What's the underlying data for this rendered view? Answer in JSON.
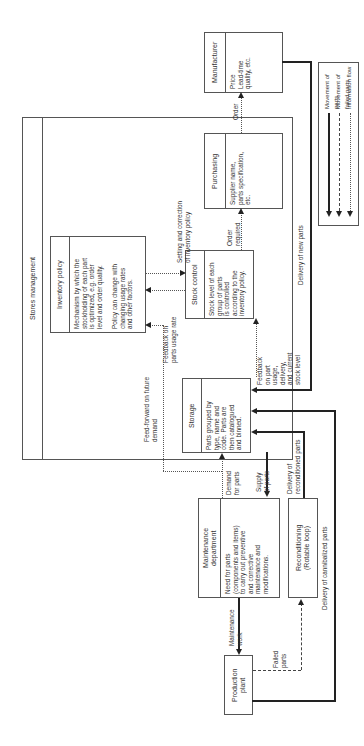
{
  "diagram": {
    "orientation": "rotated 90 degrees counter-clockwise",
    "stores_management": {
      "title": "Stores management"
    },
    "inventory_policy": {
      "title": "Inventory policy",
      "body": "Mechanism by which the\nstockholding of each part\nis optimized, e.g. order\nlevel and order quality.\n\nPolicy can change with\nchanging usage rates\nand other factors."
    },
    "stock_control": {
      "title": "Stock control",
      "body": "Stock level of each\ngroup of parts\nis controlled\naccording to the\ninventory policy."
    },
    "storage": {
      "title": "Storage",
      "body": "Parts grouped by\ntype, name and\ncode. Parts are\nthen catalogued\nand binned."
    },
    "purchasing": {
      "title": "Purchasing",
      "body": "Supplier name,\nparts specification,\netc."
    },
    "manufacturer": {
      "title": "Manufacturer",
      "body": "Price\nLead-time\nquality, etc."
    },
    "maintenance": {
      "title": "Maintenance\ndepartment",
      "body": "Need for parts\n(components and items)\nto carry out preventive\nand corrective\nmaintenance and\nmodifications."
    },
    "reconditioning": {
      "title": "Reconditioning\n(Rotable loop)"
    },
    "production_plant": {
      "title": "Production\nplant"
    },
    "flow_labels": {
      "setting_correction": "Setting and correction\nof inventory policy",
      "feedback_usage_rate": "Feedback on\nparts usage rate",
      "feed_forward": "Feed-forward on future\ndemand",
      "feedback_stock": "Feedback\non part\nusage,\ndelivery,\nand current\nstock level",
      "order_required": "Order\nrequired",
      "order": "Order",
      "delivery_new_parts": "Delivery of new parts",
      "demand_for_parts": "Demand\nfor parts",
      "supply_of_parts": "Supply\nof parts",
      "delivery_reconditioned": "Delivery of\nreconditioned parts",
      "delivery_cannibalized": "Delivery of cannibalized parts",
      "maintenance_work": "Maintenance\nwork",
      "failed_parts": "Failed\nparts"
    },
    "legend": {
      "items": [
        {
          "label": "Movement of parts",
          "style": "solid"
        },
        {
          "label": "Movement of failed parts",
          "style": "dashed"
        },
        {
          "label": "Information flow",
          "style": "dotted"
        }
      ]
    }
  }
}
